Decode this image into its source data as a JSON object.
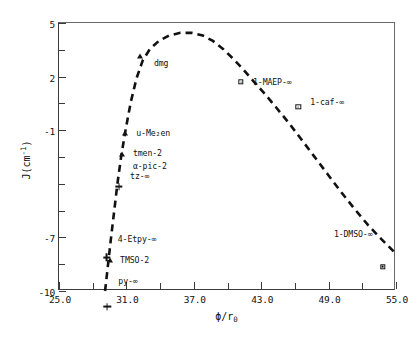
{
  "chart_data": {
    "type": "scatter",
    "title": "",
    "xlabel": "ϕ/r₀",
    "ylabel": "J(cm⁻¹)",
    "xlim": [
      25.0,
      55.0
    ],
    "ylim": [
      -10,
      5
    ],
    "grid": false,
    "legend": "none",
    "x_ticks_major": [
      "25.0",
      "31.0",
      "37.0",
      "43.0",
      "49.0",
      "55.0"
    ],
    "x_tick_values": [
      25.0,
      31.0,
      37.0,
      43.0,
      49.0,
      55.0
    ],
    "x_minor_tick_values": [
      28.0,
      34.0,
      40.0,
      46.0,
      52.0
    ],
    "y_ticks_major": [
      "5",
      "2",
      "-1",
      "-7",
      "-10"
    ],
    "y_tick_values": [
      5,
      2,
      -1,
      -7,
      -10
    ],
    "y_minor_tick_values": [
      3.5,
      0.5,
      -2.5,
      -4.0,
      -5.5,
      -8.5
    ],
    "points": [
      {
        "label": "dmg",
        "x": 32.2,
        "y": 3.15,
        "marker": "triangle",
        "label_side": "right",
        "label_dx": 14,
        "label_dy": 7
      },
      {
        "label": "1-MAEP-∞",
        "x": 41.2,
        "y": 1.7,
        "marker": "square",
        "label_side": "right",
        "label_dx": 12,
        "label_dy": 0
      },
      {
        "label": "1-caf-∞",
        "x": 46.3,
        "y": 0.6,
        "marker": "square",
        "label_side": "right",
        "label_dx": 12,
        "label_dy": 0
      },
      {
        "label": "u-Me₂en",
        "x": 30.9,
        "y": -1.15,
        "marker": "triangle",
        "label_side": "right",
        "label_dx": 11,
        "label_dy": 0
      },
      {
        "label": "tmen-2",
        "x": 30.6,
        "y": -2.35,
        "marker": "triangle",
        "label_side": "right",
        "label_dx": 11,
        "label_dy": -1
      },
      {
        "label": "α-pic-2",
        "x": 30.6,
        "y": -3.0,
        "marker": "none",
        "label_side": "right",
        "label_dx": 11,
        "label_dy": 0
      },
      {
        "label": "tz-∞",
        "x": 30.35,
        "y": -3.55,
        "marker": "plus",
        "label_side": "right",
        "label_dx": 11,
        "label_dy": 0
      },
      {
        "label": "4-Etpy-∞",
        "x": 29.25,
        "y": -7.1,
        "marker": "plus",
        "label_side": "right",
        "label_dx": 11,
        "label_dy": 0
      },
      {
        "label": "TMSO-2",
        "x": 29.55,
        "y": -8.25,
        "marker": "triangle",
        "label_side": "right",
        "label_dx": 10,
        "label_dy": 0
      },
      {
        "label": "py-∞",
        "x": 29.3,
        "y": -9.45,
        "marker": "plus",
        "label_side": "right",
        "label_dx": 11,
        "label_dy": 0
      },
      {
        "label": "1-DMSO-∞",
        "x": 53.8,
        "y": -6.8,
        "marker": "square",
        "label_side": "left",
        "label_dx": -10,
        "label_dy": 0
      }
    ],
    "trend_line": {
      "style": "dashed",
      "color": "#111111",
      "points": [
        [
          29.1,
          -10.0
        ],
        [
          29.35,
          -8.6
        ],
        [
          29.6,
          -7.2
        ],
        [
          29.9,
          -5.6
        ],
        [
          30.2,
          -4.0
        ],
        [
          30.55,
          -2.4
        ],
        [
          30.95,
          -0.9
        ],
        [
          31.4,
          0.6
        ],
        [
          31.9,
          1.9
        ],
        [
          32.45,
          2.9
        ],
        [
          33.1,
          3.55
        ],
        [
          33.9,
          4.0
        ],
        [
          34.8,
          4.3
        ],
        [
          35.8,
          4.45
        ],
        [
          36.8,
          4.45
        ],
        [
          37.8,
          4.3
        ],
        [
          38.7,
          4.0
        ],
        [
          39.6,
          3.55
        ],
        [
          40.5,
          3.0
        ],
        [
          41.4,
          2.4
        ],
        [
          42.3,
          1.75
        ],
        [
          43.3,
          1.05
        ],
        [
          44.3,
          0.3
        ],
        [
          45.4,
          -0.55
        ],
        [
          46.5,
          -1.45
        ],
        [
          47.7,
          -2.45
        ],
        [
          48.9,
          -3.45
        ],
        [
          50.1,
          -4.45
        ],
        [
          51.3,
          -5.4
        ],
        [
          52.5,
          -6.3
        ],
        [
          53.7,
          -7.1
        ],
        [
          54.9,
          -7.85
        ]
      ]
    }
  },
  "axes": {
    "y_title": "J(cm",
    "y_title_sup": "-1",
    "y_title_end": ")",
    "x_title_phi": "ϕ/r",
    "x_title_sub": "0"
  }
}
